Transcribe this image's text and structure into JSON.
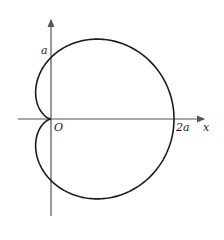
{
  "diagram": {
    "type": "polar-curve",
    "curve": "cardioid r = a(1 + cos θ)",
    "labels": {
      "y_intercept": "a",
      "origin": "O",
      "x_intercept": "2a",
      "x_axis": "x"
    },
    "colors": {
      "curve": "#1a1a1a",
      "axes": "#555555"
    }
  }
}
